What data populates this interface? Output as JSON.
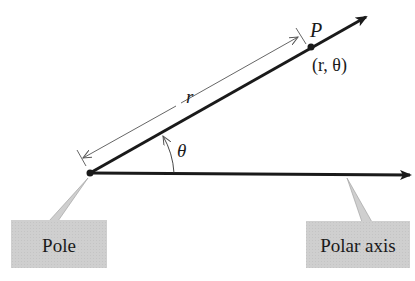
{
  "diagram": {
    "labels": {
      "point": "P",
      "coords": "(r, θ)",
      "radius": "r",
      "angle": "θ",
      "pole_box": "Pole",
      "axis_box": "Polar axis"
    },
    "colors": {
      "line": "#1a1a1a",
      "dimension": "#555555",
      "callout_fill": "#cfcfcf"
    },
    "geometry": {
      "pole": [
        90,
        173
      ],
      "polar_axis_end": [
        412,
        175
      ],
      "ray_end": [
        368,
        16
      ],
      "point_P": [
        311,
        47
      ]
    }
  }
}
